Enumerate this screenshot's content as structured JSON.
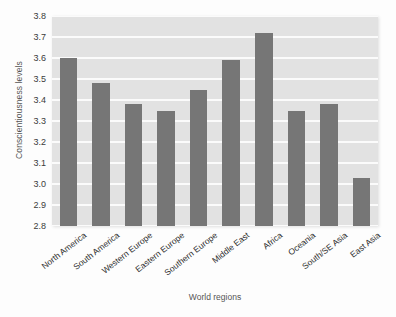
{
  "chart_data": {
    "type": "bar",
    "title": "",
    "xlabel": "World regions",
    "ylabel": "Conscientiousness levels",
    "categories": [
      "North America",
      "South America",
      "Western Europe",
      "Eastern Europe",
      "Southern Europe",
      "Middle East",
      "Africa",
      "Oceania",
      "South/SE Asia",
      "East Asia"
    ],
    "values": [
      3.6,
      3.48,
      3.38,
      3.35,
      3.45,
      3.59,
      3.72,
      3.35,
      3.38,
      3.03
    ],
    "ylim": [
      2.8,
      3.8
    ],
    "yticks": [
      "2.8",
      "2.9",
      "3.0",
      "3.1",
      "3.2",
      "3.3",
      "3.4",
      "3.5",
      "3.6",
      "3.7",
      "3.8"
    ],
    "ytick_values": [
      2.8,
      2.9,
      3.0,
      3.1,
      3.2,
      3.3,
      3.4,
      3.5,
      3.6,
      3.7,
      3.8
    ],
    "grid": true,
    "legend": "none",
    "bar_color": "#767676",
    "plot_background_color": "#e2e2e2",
    "gridline_color": "#fbfbfb",
    "page_background_color": "#fdfdfd"
  }
}
